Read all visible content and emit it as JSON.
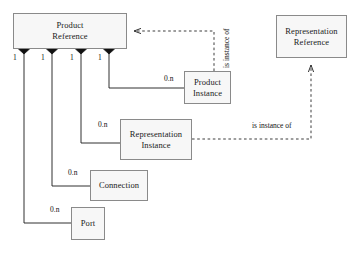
{
  "diagram": {
    "type": "uml-class-diagram",
    "colors": {
      "box_fill": "#f7f7f7",
      "box_border": "#8a8a8a",
      "line": "#1a1a1a",
      "text": "#1a1a1a",
      "background": "#ffffff"
    },
    "classes": [
      {
        "id": "product-reference",
        "label": "Product\nReference",
        "x": 13,
        "y": 13,
        "width": 114,
        "height": 36
      },
      {
        "id": "representation-reference",
        "label": "Representation\nReference",
        "x": 276,
        "y": 15,
        "width": 71,
        "height": 43
      },
      {
        "id": "product-instance",
        "label": "Product\nInstance",
        "x": 184,
        "y": 71,
        "width": 47,
        "height": 33
      },
      {
        "id": "representation-instance",
        "label": "Representation\nInstance",
        "x": 120,
        "y": 119,
        "width": 72,
        "height": 41
      },
      {
        "id": "connection",
        "label": "Connection",
        "x": 90,
        "y": 170,
        "width": 58,
        "height": 31
      },
      {
        "id": "port",
        "label": "Port",
        "x": 71,
        "y": 207,
        "width": 34,
        "height": 33
      }
    ],
    "multiplicities": {
      "one_a": "1",
      "one_b": "1",
      "one_c": "1",
      "one_d": "1",
      "zero_n_product_instance": "0.n",
      "zero_n_representation_instance": "0.n",
      "zero_n_connection": "0.n",
      "zero_n_port": "0.n"
    },
    "associations": [
      {
        "id": "assoc-port",
        "from": "product-reference",
        "to": "port",
        "source_multiplicity": "1",
        "target_multiplicity": "0.n",
        "aggregation": "composite"
      },
      {
        "id": "assoc-connection",
        "from": "product-reference",
        "to": "connection",
        "source_multiplicity": "1",
        "target_multiplicity": "0.n",
        "aggregation": "composite"
      },
      {
        "id": "assoc-representation-instance",
        "from": "product-reference",
        "to": "representation-instance",
        "source_multiplicity": "1",
        "target_multiplicity": "0.n",
        "aggregation": "composite"
      },
      {
        "id": "assoc-product-instance",
        "from": "product-reference",
        "to": "product-instance",
        "source_multiplicity": "1",
        "target_multiplicity": "0.n",
        "aggregation": "composite"
      }
    ],
    "dependencies": [
      {
        "id": "dep-product-instance",
        "label": "is instance of",
        "from": "product-instance",
        "to": "product-reference",
        "orientation": "vertical"
      },
      {
        "id": "dep-representation-instance",
        "label": "is instance of",
        "from": "representation-instance",
        "to": "representation-reference",
        "orientation": "horizontal"
      }
    ]
  }
}
